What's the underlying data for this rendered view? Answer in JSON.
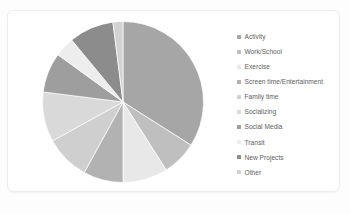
{
  "card": {
    "background_color": "#ffffff",
    "border_color": "#ededed"
  },
  "legend": {
    "position": "right",
    "items": [
      {
        "label": "Activity",
        "color": "#a6a6a6"
      },
      {
        "label": "Work/School",
        "color": "#bfbfbf"
      },
      {
        "label": "Exercise",
        "color": "#e8e8e8"
      },
      {
        "label": "Screen time/Entertainment",
        "color": "#b2b2b2"
      },
      {
        "label": "Family time",
        "color": "#cfcfcf"
      },
      {
        "label": "Socializing",
        "color": "#d9d9d9"
      },
      {
        "label": "Social Media",
        "color": "#9e9e9e"
      },
      {
        "label": "Transit",
        "color": "#ededed"
      },
      {
        "label": "New Projects",
        "color": "#8c8c8c"
      },
      {
        "label": "Other",
        "color": "#d2d2d2"
      }
    ]
  },
  "chart_data": {
    "type": "pie",
    "title": "",
    "labels": [
      "Activity",
      "Work/School",
      "Exercise",
      "Screen time/Entertainment",
      "Family time",
      "Socializing",
      "Social Media",
      "Transit",
      "New Projects",
      "Other"
    ],
    "values": [
      34,
      7,
      9,
      8,
      9,
      10,
      8,
      4,
      9,
      2
    ],
    "colors": [
      "#a6a6a6",
      "#bfbfbf",
      "#e8e8e8",
      "#b2b2b2",
      "#cfcfcf",
      "#d9d9d9",
      "#9e9e9e",
      "#ededed",
      "#8c8c8c",
      "#d2d2d2"
    ],
    "start_angle": 0,
    "direction": "clockwise",
    "legend": "right",
    "grid": false,
    "data_labels": false
  }
}
